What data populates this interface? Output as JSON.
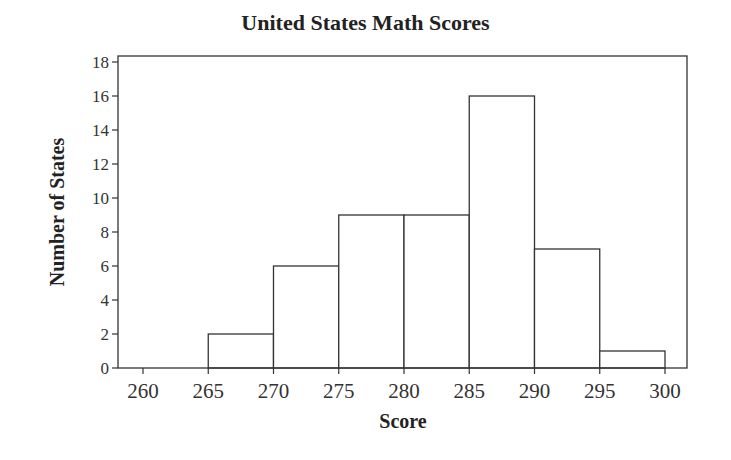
{
  "chart_data": {
    "type": "bar",
    "subtype": "histogram",
    "title": "United States Math Scores",
    "xlabel": "Score",
    "ylabel": "Number of States",
    "bins": [
      [
        265,
        270
      ],
      [
        270,
        275
      ],
      [
        275,
        280
      ],
      [
        280,
        285
      ],
      [
        285,
        290
      ],
      [
        290,
        295
      ],
      [
        295,
        300
      ]
    ],
    "categories": [
      "265-270",
      "270-275",
      "275-280",
      "280-285",
      "285-290",
      "290-295",
      "295-300"
    ],
    "values": [
      2,
      6,
      9,
      9,
      16,
      7,
      1
    ],
    "xlim": [
      258.5,
      301.7
    ],
    "ylim": [
      0,
      18.4
    ],
    "x_ticks": [
      260,
      265,
      270,
      275,
      280,
      285,
      290,
      295,
      300
    ],
    "y_ticks": [
      0,
      2,
      4,
      6,
      8,
      10,
      12,
      14,
      16,
      18
    ],
    "grid": false,
    "legend": null
  },
  "colors": {
    "bar_fill": "#ffffff",
    "bar_edge": "#333333",
    "axis": "#333333"
  }
}
